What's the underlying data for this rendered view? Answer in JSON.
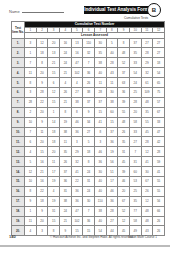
{
  "header": {
    "name_label": "Name",
    "title": "Individual Test Analysis Form",
    "badge": "B",
    "subtitle": "Cumulative Tests"
  },
  "table": {
    "corner_label": "Test Item No.",
    "cumulative_header": "Cumulative Test Number",
    "lesson_header": "Lesson Assessed",
    "columns": [
      "1",
      "2",
      "3",
      "4",
      "5",
      "6",
      "7",
      "8",
      "9",
      "10",
      "11",
      "12"
    ],
    "rows": [
      {
        "no": "1.",
        "cells": [
          "3",
          "12",
          "20",
          "16",
          "13",
          "110",
          "30",
          "5",
          "8",
          "37",
          "27",
          "27"
        ]
      },
      {
        "no": "2.",
        "cells": [
          "1",
          "18",
          "13",
          "24",
          "16",
          "32",
          "35",
          "40",
          "48",
          "35",
          "28",
          "27"
        ]
      },
      {
        "no": "3.",
        "cells": [
          "7",
          "8",
          "21",
          "24",
          "47",
          "7",
          "38",
          "28",
          "52",
          "33",
          "29",
          "18"
        ]
      },
      {
        "no": "4.",
        "cells": [
          "11",
          "20",
          "15",
          "21",
          "102",
          "36",
          "40",
          "43",
          "37",
          "54",
          "32",
          "54"
        ]
      },
      {
        "no": "5.",
        "cells": [
          "8",
          "9",
          "6",
          "4",
          "4",
          "26",
          "11",
          "11",
          "63",
          "24",
          "61",
          "65"
        ]
      },
      {
        "no": "6.",
        "cells": [
          "3",
          "28",
          "12",
          "26",
          "27",
          "38",
          "28",
          "30",
          "36",
          "25",
          "109",
          "75"
        ]
      },
      {
        "no": "7.",
        "cells": [
          "28",
          "22",
          "15",
          "21",
          "38",
          "37",
          "37",
          "38",
          "39",
          "28",
          "48",
          "57"
        ]
      },
      {
        "no": "8.",
        "cells": [
          "2",
          "20",
          "1",
          "8",
          "8",
          "9",
          "15",
          "60",
          "55",
          "20",
          "35",
          "67"
        ]
      },
      {
        "no": "9.",
        "cells": [
          "10",
          "9",
          "14",
          "19",
          "46",
          "34",
          "41",
          "15",
          "48",
          "58",
          "55",
          "33"
        ]
      },
      {
        "no": "10.",
        "cells": [
          "7",
          "11",
          "18",
          "38",
          "36",
          "27",
          "8",
          "37",
          "26",
          "33",
          "45",
          "47"
        ]
      },
      {
        "no": "11.",
        "cells": [
          "6",
          "20",
          "18",
          "11",
          "3",
          "5",
          "3",
          "36",
          "35",
          "27",
          "28",
          "42"
        ]
      },
      {
        "no": "12.",
        "cells": [
          "4",
          "15",
          "20",
          "35",
          "29",
          "18",
          "46",
          "19",
          "31",
          "7",
          "12",
          "28"
        ]
      },
      {
        "no": "13.",
        "cells": [
          "5",
          "16",
          "11",
          "26",
          "32",
          "8",
          "36",
          "56",
          "45",
          "31",
          "41",
          "59"
        ]
      },
      {
        "no": "14.",
        "cells": [
          "12",
          "21",
          "17",
          "37",
          "41",
          "24",
          "30",
          "51",
          "39",
          "60",
          "30",
          "41"
        ]
      },
      {
        "no": "15.",
        "cells": [
          "10",
          "16",
          "19",
          "36",
          "22",
          "31",
          "40",
          "17",
          "46",
          "53",
          "67",
          "55"
        ]
      },
      {
        "no": "16.",
        "cells": [
          "8",
          "22",
          "4",
          "31",
          "36",
          "24",
          "40",
          "46",
          "20",
          "25",
          "26",
          "55"
        ]
      },
      {
        "no": "17.",
        "cells": [
          "9",
          "18",
          "19",
          "38",
          "36",
          "30",
          "110",
          "36",
          "67",
          "35",
          "12",
          "56"
        ]
      },
      {
        "no": "18.",
        "cells": [
          "1",
          "9",
          "31",
          "24",
          "47",
          "7",
          "38",
          "28",
          "52",
          "77",
          "48",
          "66"
        ]
      },
      {
        "no": "19.",
        "cells": [
          "11",
          "20",
          "15",
          "21",
          "102",
          "36",
          "40",
          "27",
          "12",
          "58",
          "48",
          "26"
        ]
      },
      {
        "no": "20.",
        "cells": [
          "4",
          "3",
          "8",
          "9",
          "15",
          "15",
          "54",
          "44",
          "45",
          "49",
          "43",
          "26"
        ]
      }
    ]
  },
  "footer": {
    "page_number": "140",
    "copyright": "© Harcourt Achieve Inc. and Stephen Hake. All rights reserved.",
    "book": "Saxon Math Course 1"
  }
}
